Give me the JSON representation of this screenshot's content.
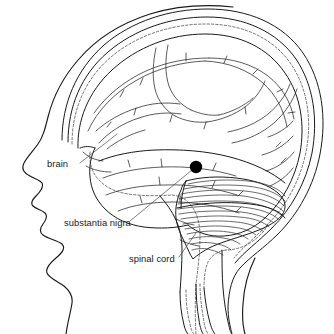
{
  "figure": {
    "background_color": "#ffffff",
    "ink_color": "#1a1a1a",
    "marker_color": "#000000",
    "width": 334,
    "height": 334
  },
  "labels": [
    {
      "id": "brain",
      "text": "brain",
      "x": 47,
      "y": 167,
      "leader": {
        "x1": 80,
        "y1": 163,
        "x2": 117,
        "y2": 134
      }
    },
    {
      "id": "substantia-nigra",
      "text": "substantia nigra",
      "x": 64,
      "y": 226,
      "leader": {
        "x1": 130,
        "y1": 221,
        "x2": 192,
        "y2": 170
      }
    },
    {
      "id": "spinal-cord",
      "text": "spinal cord",
      "x": 129,
      "y": 262,
      "leader": {
        "x1": 179,
        "y1": 257,
        "x2": 196,
        "y2": 233
      }
    }
  ],
  "marker": {
    "id": "substantia-nigra-dot",
    "name": "substantia nigra",
    "cx": 196,
    "cy": 167,
    "r": 6.2
  },
  "structures": [
    {
      "id": "head-profile",
      "name": "head profile outline"
    },
    {
      "id": "skull-outline",
      "name": "skull outline"
    },
    {
      "id": "meninges",
      "name": "meninges dashed line"
    },
    {
      "id": "cerebrum",
      "name": "cerebrum"
    },
    {
      "id": "cerebellum",
      "name": "cerebellum"
    },
    {
      "id": "brainstem",
      "name": "brainstem"
    },
    {
      "id": "spinal-cord",
      "name": "spinal cord"
    }
  ]
}
